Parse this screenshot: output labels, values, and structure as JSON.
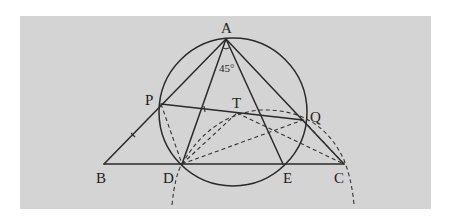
{
  "diagram": {
    "background_color": "#d4d4d4",
    "points": {
      "A": {
        "label": "A",
        "x": 226,
        "y": 39,
        "lx": 221,
        "ly": 33
      },
      "P": {
        "label": "P",
        "x": 161,
        "y": 104,
        "lx": 145,
        "ly": 104
      },
      "Q": {
        "label": "Q",
        "x": 303,
        "y": 120,
        "lx": 310,
        "ly": 121
      },
      "T": {
        "label": "T",
        "x": 237,
        "y": 113,
        "lx": 232,
        "ly": 108
      },
      "B": {
        "label": "B",
        "x": 104,
        "y": 164,
        "lx": 96,
        "ly": 183
      },
      "D": {
        "label": "D",
        "x": 182,
        "y": 164,
        "lx": 163,
        "ly": 183
      },
      "E": {
        "label": "E",
        "x": 283,
        "y": 164,
        "lx": 283,
        "ly": 183
      },
      "C": {
        "label": "C",
        "x": 344,
        "y": 164,
        "lx": 334,
        "ly": 183
      }
    },
    "angle_label": "45°",
    "circle": {
      "cx": 233,
      "cy": 112,
      "r": 73
    },
    "solid_segments": [
      "AB",
      "AC",
      "BC",
      "AD",
      "AE",
      "PQ"
    ],
    "dashed_segments": [
      "PD",
      "DT",
      "DQ",
      "TC",
      "QC"
    ],
    "dashed_arc": "circle centered at D through C"
  }
}
